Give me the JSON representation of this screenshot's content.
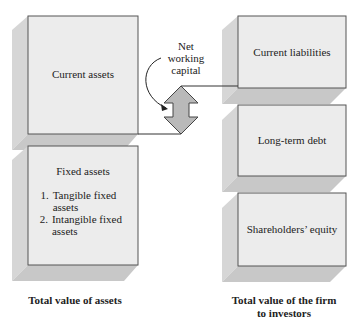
{
  "colors": {
    "box_face": "#ececec",
    "box_side": "#d4d4d4",
    "box_bottom": "#c6c6c6",
    "box_border": "#555555",
    "arrow_fill": "#b9b9b9"
  },
  "left": {
    "current_assets": "Current assets",
    "fixed_assets": {
      "title": "Fixed assets",
      "items": [
        {
          "num": "1.",
          "text": "Tangible fixed assets"
        },
        {
          "num": "2.",
          "text": "Intangible fixed assets"
        }
      ]
    },
    "caption": "Total value of assets"
  },
  "right": {
    "current_liabilities": "Current liabilities",
    "long_term_debt": "Long-term debt",
    "shareholders_equity": "Shareholders’ equity",
    "caption_line1": "Total value of the firm",
    "caption_line2": "to investors"
  },
  "net_working_capital": {
    "line1": "Net",
    "line2": "working",
    "line3": "capital"
  }
}
